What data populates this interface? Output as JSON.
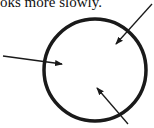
{
  "caption": "oks more slowly.",
  "figure": {
    "shape": "circle",
    "arrows": [
      {
        "name": "arrow-left",
        "from": [
          3,
          56
        ],
        "to": [
          62,
          64
        ]
      },
      {
        "name": "arrow-top-right",
        "from": [
          152,
          4
        ],
        "to": [
          116,
          44
        ]
      },
      {
        "name": "arrow-bottom",
        "from": [
          128,
          124
        ],
        "to": [
          97,
          88
        ]
      }
    ],
    "stroke_color": "#1a1a1a"
  }
}
